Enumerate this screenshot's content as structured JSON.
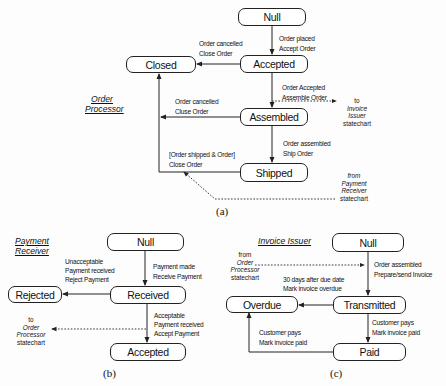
{
  "panels": {
    "a": {
      "caption": "(a)",
      "title_line1": "Order",
      "title_line2": "Processor",
      "states": {
        "null": "Null",
        "accepted": "Accepted",
        "closed": "Closed",
        "assembled": "Assembled",
        "shipped": "Shipped"
      },
      "transitions": {
        "null_to_accepted": [
          "Order placed",
          "Accept  Order"
        ],
        "accepted_to_closed": [
          "Order cancelled",
          "Close Order"
        ],
        "accepted_to_assembled": [
          "Order Accepted",
          "Assemble Order"
        ],
        "assembled_to_closed": [
          "Order cancelled",
          "Cluse Order"
        ],
        "assembled_to_shipped": [
          "Order assembled",
          "Ship Order"
        ],
        "shipped_to_closed": [
          "[Order shipped & Order]",
          "Close Order"
        ]
      },
      "notes": {
        "to_invoice": [
          "to",
          "Invoice",
          "Issuer",
          "statechart"
        ],
        "from_payment": [
          "from",
          "Payment",
          "Receiver",
          "statechart"
        ]
      }
    },
    "b": {
      "caption": "(b)",
      "title_line1": "Payment",
      "title_line2": "Receiver",
      "states": {
        "null": "Null",
        "received": "Received",
        "rejected": "Rejected",
        "accepted": "Accepted"
      },
      "transitions": {
        "null_to_received": [
          "Payment made",
          "Receive Payment"
        ],
        "received_to_rejected": [
          "Unacceptable",
          "Payment received",
          "Reject Payment"
        ],
        "received_to_accepted": [
          "Acceptable",
          "Payment received",
          "Accept  Payment"
        ]
      },
      "notes": {
        "to_order": [
          "to",
          "Order",
          "Processor",
          "statechart"
        ]
      }
    },
    "c": {
      "caption": "(c)",
      "title": "Invoice Issuer",
      "states": {
        "null": "Null",
        "transmitted": "Transmitted",
        "overdue": "Overdue",
        "paid": "Paid"
      },
      "transitions": {
        "null_to_transmitted": [
          "Order assembled",
          "Prepare/send Invoice"
        ],
        "transmitted_to_overdue": [
          "30 days after due date",
          "Mark invoice overdue"
        ],
        "transmitted_to_paid": [
          "Customer pays",
          "Mark invoice paid"
        ],
        "paid_to_overdue": [
          "Customer pays",
          "Mark invoice paid"
        ]
      },
      "notes": {
        "from_order": [
          "from",
          "Order",
          "Processor",
          "statechart"
        ]
      }
    }
  }
}
